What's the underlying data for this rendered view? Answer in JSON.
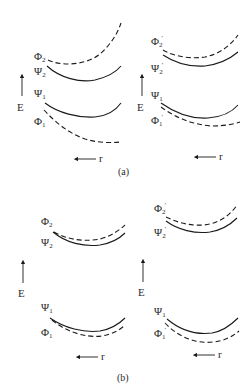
{
  "figure": {
    "panels": [
      {
        "caption": "(a)",
        "subpanels": [
          {
            "position": "left",
            "axis_label_E": "E",
            "axis_label_r": "r",
            "curves": [
              {
                "label_main": "Φ",
                "label_sub": "2",
                "label_prime": "",
                "style": "dashed"
              },
              {
                "label_main": "Ψ",
                "label_sub": "2",
                "label_prime": "",
                "style": "solid"
              },
              {
                "label_main": "Ψ",
                "label_sub": "1",
                "label_prime": "",
                "style": "solid"
              },
              {
                "label_main": "Φ",
                "label_sub": "1",
                "label_prime": "",
                "style": "dashed"
              }
            ]
          },
          {
            "position": "right",
            "axis_label_E": "E",
            "axis_label_r": "r",
            "curves": [
              {
                "label_main": "Φ",
                "label_sub": "2",
                "label_prime": "′",
                "style": "dashed"
              },
              {
                "label_main": "Ψ",
                "label_sub": "2",
                "label_prime": "′",
                "style": "solid"
              },
              {
                "label_main": "Ψ",
                "label_sub": "1",
                "label_prime": "",
                "style": "solid"
              },
              {
                "label_main": "Φ",
                "label_sub": "1",
                "label_prime": "′",
                "style": "dashed"
              }
            ]
          }
        ]
      },
      {
        "caption": "(b)",
        "subpanels": [
          {
            "position": "left",
            "axis_label_E": "E",
            "axis_label_r": "r",
            "curves": [
              {
                "label_main": "Φ",
                "label_sub": "2",
                "label_prime": "",
                "style": "dashed"
              },
              {
                "label_main": "Ψ",
                "label_sub": "2",
                "label_prime": "",
                "style": "solid"
              },
              {
                "label_main": "Ψ",
                "label_sub": "1",
                "label_prime": "",
                "style": "solid"
              },
              {
                "label_main": "Φ",
                "label_sub": "1",
                "label_prime": "",
                "style": "dashed"
              }
            ]
          },
          {
            "position": "right",
            "axis_label_E": "E",
            "axis_label_r": "r",
            "curves": [
              {
                "label_main": "Φ",
                "label_sub": "2",
                "label_prime": "′",
                "style": "dashed"
              },
              {
                "label_main": "Ψ",
                "label_sub": "2",
                "label_prime": "′",
                "style": "solid"
              },
              {
                "label_main": "Ψ",
                "label_sub": "1",
                "label_prime": "",
                "style": "solid"
              },
              {
                "label_main": "Φ",
                "label_sub": "1",
                "label_prime": "′",
                "style": "dashed"
              }
            ]
          }
        ]
      }
    ]
  }
}
